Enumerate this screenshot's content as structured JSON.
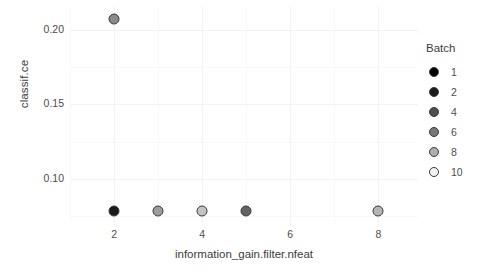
{
  "chart_data": {
    "type": "scatter",
    "title": "",
    "xlabel": "information_gain.filter.nfeat",
    "ylabel": "classif.ce",
    "xlim": [
      1.0,
      8.9
    ],
    "ylim": [
      0.069,
      0.216
    ],
    "xticks": [
      2,
      4,
      6,
      8
    ],
    "xtick_labels": [
      "2",
      "4",
      "6",
      "8"
    ],
    "yticks": [
      0.1,
      0.15,
      0.2
    ],
    "ytick_labels": [
      "0.10",
      "0.15",
      "0.20"
    ],
    "grid": true,
    "legend_position": "right",
    "legend": {
      "title": "Batch",
      "entries": [
        {
          "label": "1",
          "value": 1,
          "color": "#000000"
        },
        {
          "label": "2",
          "value": 2,
          "color": "#1c1c1c"
        },
        {
          "label": "4",
          "value": 4,
          "color": "#4f4f4f"
        },
        {
          "label": "6",
          "value": 6,
          "color": "#777777"
        },
        {
          "label": "8",
          "value": 8,
          "color": "#adadad"
        },
        {
          "label": "10",
          "value": 10,
          "color": "#f2f2f2"
        }
      ]
    },
    "points": [
      {
        "x": 2.0,
        "y": 0.2075,
        "batch": 6,
        "color": "#8a8a8a"
      },
      {
        "x": 2.0,
        "y": 0.0782,
        "batch": 1,
        "color": "#1a1a1a"
      },
      {
        "x": 3.0,
        "y": 0.0782,
        "batch": 8,
        "color": "#9c9c9c"
      },
      {
        "x": 4.0,
        "y": 0.0782,
        "batch": 10,
        "color": "#c4c4c4"
      },
      {
        "x": 5.0,
        "y": 0.0782,
        "batch": 4,
        "color": "#636363"
      },
      {
        "x": 8.0,
        "y": 0.0782,
        "batch": 8,
        "color": "#b5b5b5"
      }
    ]
  }
}
